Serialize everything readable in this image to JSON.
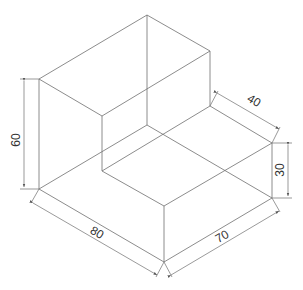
{
  "drawing": {
    "type": "isometric-technical-drawing",
    "stroke_color": "#6e6e6e",
    "text_color": "#333333",
    "dimensions": {
      "height_tall": "60",
      "length": "80",
      "depth": "70",
      "step_length": "40",
      "step_height": "30"
    }
  }
}
